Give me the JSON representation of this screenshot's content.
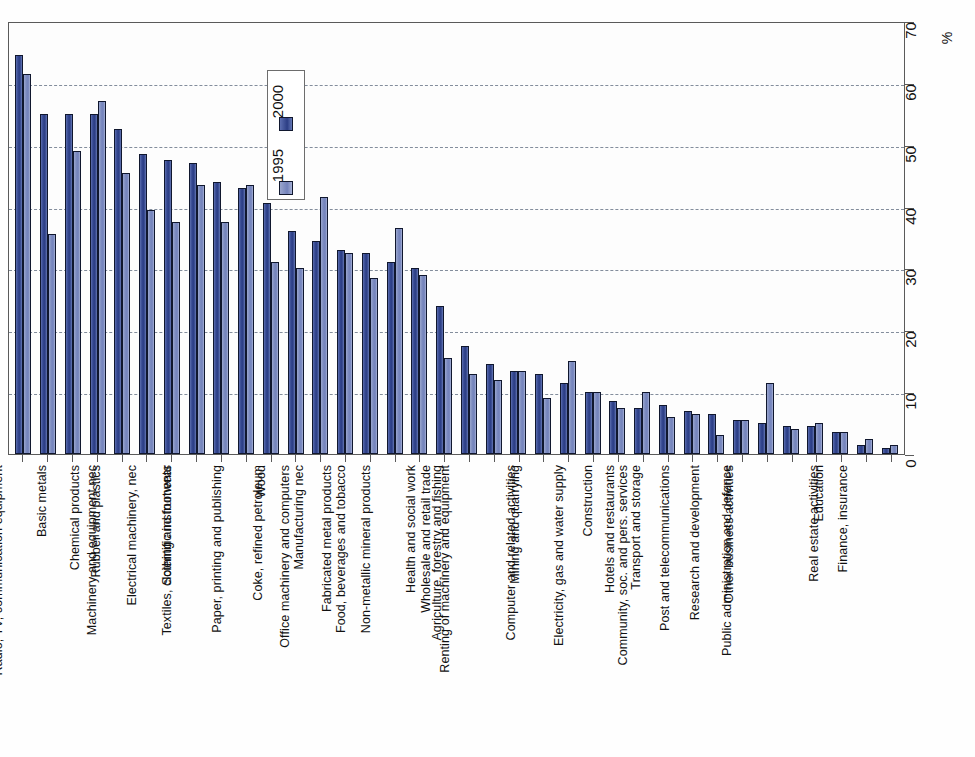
{
  "chart_data": {
    "type": "bar",
    "title": "",
    "subtitle": "",
    "xlabel": "",
    "ylabel": "%",
    "ylim": [
      0,
      70
    ],
    "ytick_step": 10,
    "yticks": [
      0,
      10,
      20,
      30,
      40,
      50,
      60,
      70
    ],
    "grid": true,
    "grid_style": "dashed-horizontal",
    "legend_position": "inside-top-left",
    "orientation": "vertical-bars-rotated-labels",
    "categories": [
      "Motor vehicles",
      "Other transport equipment",
      "Basic metals",
      "Radio, TV, communication equipment",
      "Chemical products",
      "Rubber and plastics",
      "Machinery and equipment nec",
      "Electrical machinery, nec",
      "Scientific instruments",
      "Textiles, clothing and footwear",
      "Wood",
      "Paper, printing and publishing",
      "Coke, refined petroleum",
      "Manufacturing nec",
      "Office machinery and computers",
      "Fabricated metal products",
      "Food, beverages and tobacco",
      "Non-metallic mineral products",
      "Health and social work",
      "Wholesale and retail trade",
      "Agriculture, forestry and fishing",
      "Renting of machinery and equipment",
      "Mining and quarrying",
      "Computer and related activities",
      "Construction",
      "Electricity, gas and water supply",
      "Hotels and restaurants",
      "Transport and storage",
      "Community, soc. and pers. services",
      "Post and telecommunications",
      "Research and development",
      "Other business activities",
      "Public administration and defence",
      "Education",
      "Real estate activities",
      "Finance, insurance"
    ],
    "series": [
      {
        "name": "1995",
        "color": "#2c3e85",
        "values": [
          64.5,
          55.0,
          55.0,
          55.0,
          52.5,
          48.5,
          47.5,
          47.0,
          44.0,
          43.0,
          40.5,
          36.0,
          34.5,
          33.0,
          32.5,
          31.0,
          30.0,
          24.0,
          17.5,
          14.5,
          13.5,
          13.0,
          11.5,
          10.0,
          8.5,
          7.5,
          8.0,
          7.0,
          6.5,
          5.5,
          5.0,
          4.5,
          4.5,
          3.5,
          1.5,
          1.0
        ]
      },
      {
        "name": "2000",
        "color": "#7382bb",
        "values": [
          61.5,
          35.5,
          49.0,
          57.0,
          45.5,
          39.5,
          37.5,
          43.5,
          37.5,
          43.5,
          31.0,
          30.0,
          41.5,
          32.5,
          28.5,
          36.5,
          29.0,
          15.5,
          13.0,
          12.0,
          13.5,
          9.0,
          15.0,
          10.0,
          7.5,
          10.0,
          6.0,
          6.5,
          3.0,
          5.5,
          11.5,
          4.0,
          5.0,
          3.5,
          2.5,
          1.5
        ]
      }
    ]
  },
  "legend": {
    "entries": [
      {
        "label": "2000",
        "swatch_class": "sw-2000"
      },
      {
        "label": "1995",
        "swatch_class": "sw-1995"
      }
    ]
  },
  "axis": {
    "unit_label": "%",
    "tick_labels": [
      "0",
      "10",
      "20",
      "30",
      "40",
      "50",
      "60",
      "70"
    ]
  },
  "colors": {
    "series_1995": "#2c3e85",
    "series_2000": "#7382bb",
    "gridline": "#6e7a8c",
    "frame": "#5a5a5a"
  }
}
